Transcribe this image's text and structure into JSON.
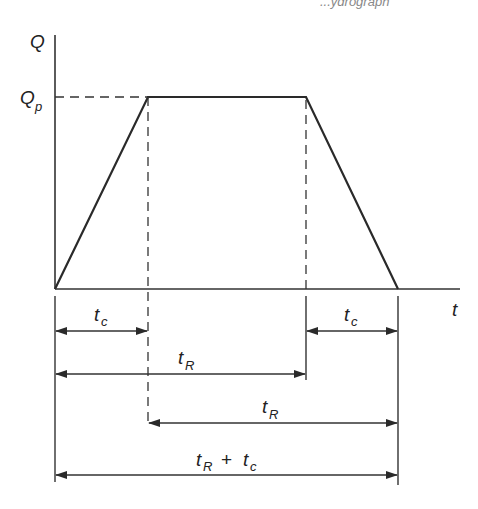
{
  "header_fragment": "...ydrograph",
  "axes": {
    "y_label": "Q",
    "x_label": "t",
    "peak_label": {
      "main": "Q",
      "sub": "p"
    }
  },
  "shape": {
    "type": "trapezoidal hydrograph",
    "vertices": [
      [
        55,
        289
      ],
      [
        148,
        97
      ],
      [
        306,
        97
      ],
      [
        398,
        289
      ]
    ]
  },
  "dimensions": [
    {
      "id": "tc-rise",
      "main": "t",
      "sub": "c",
      "from_x": 55,
      "to_x": 148,
      "y": 331
    },
    {
      "id": "tc-fall",
      "main": "t",
      "sub": "c",
      "from_x": 306,
      "to_x": 398,
      "y": 331
    },
    {
      "id": "tR-first",
      "main": "t",
      "sub": "R",
      "from_x": 55,
      "to_x": 306,
      "y": 374
    },
    {
      "id": "tR-second",
      "main": "t",
      "sub": "R",
      "from_x": 148,
      "to_x": 398,
      "y": 423
    },
    {
      "id": "tR-plus-tc",
      "main": "t",
      "sub": "R",
      "op": "+",
      "main2": "t",
      "sub2": "c",
      "from_x": 55,
      "to_x": 398,
      "y": 475
    }
  ],
  "colors": {
    "ink": "#2a2a2a",
    "background": "#ffffff"
  }
}
